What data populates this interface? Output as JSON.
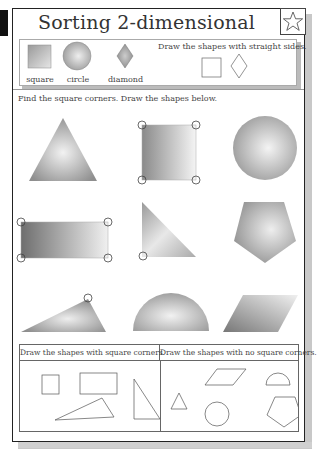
{
  "worksheet": {
    "title": "Sorting 2-dimensional shapes",
    "star_icon": "star-outline-icon",
    "legend": {
      "items": [
        {
          "label": "square",
          "shape": "square"
        },
        {
          "label": "circle",
          "shape": "circle"
        },
        {
          "label": "diamond",
          "shape": "diamond"
        }
      ],
      "instruction": "Draw the shapes with straight sides."
    },
    "section_instruction": "Find the square corners. Draw the shapes below.",
    "shapes": [
      {
        "name": "equilateral-triangle",
        "square_corners": 0
      },
      {
        "name": "square",
        "square_corners": 4
      },
      {
        "name": "circle",
        "square_corners": 0
      },
      {
        "name": "rectangle",
        "square_corners": 4
      },
      {
        "name": "right-triangle",
        "square_corners": 1
      },
      {
        "name": "pentagon",
        "square_corners": 0
      },
      {
        "name": "obtuse-triangle",
        "square_corners": 1
      },
      {
        "name": "semicircle",
        "square_corners": 0
      },
      {
        "name": "parallelogram",
        "square_corners": 0
      }
    ],
    "table": {
      "col1_header": "Draw the shapes with square corners.",
      "col2_header": "Draw the shapes with no square corners.",
      "col1_shapes": [
        "square",
        "rectangle",
        "obtuse-triangle",
        "right-triangle"
      ],
      "col2_shapes": [
        "triangle",
        "parallelogram",
        "semicircle",
        "circle",
        "pentagon"
      ]
    }
  }
}
